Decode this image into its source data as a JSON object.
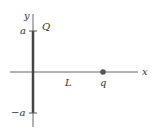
{
  "diagram": {
    "axes": {
      "x_label": "x",
      "y_label": "y"
    },
    "ticks": {
      "top": "a",
      "bottom": "−a"
    },
    "labels": {
      "line_charge": "Q",
      "distance": "L",
      "point_charge": "q"
    },
    "colors": {
      "axis": "#555555",
      "line_charge": "#444444",
      "point_charge": "#555555",
      "text": "#333333"
    }
  }
}
